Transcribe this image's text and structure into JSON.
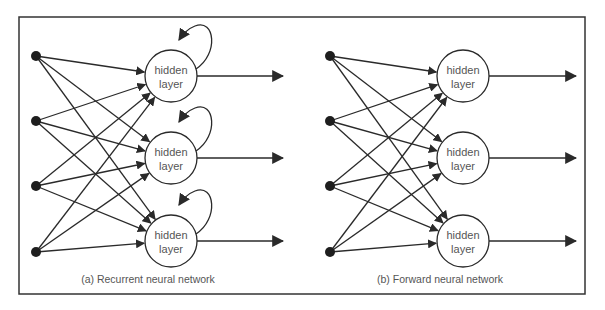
{
  "diagram": {
    "colors": {
      "stroke": "#2a2a2a",
      "text": "#555555",
      "frame": "#333333",
      "background": "#ffffff"
    },
    "frame": {
      "x": 19,
      "y": 17,
      "width": 566,
      "height": 277
    },
    "panels": [
      {
        "id": "recurrent",
        "caption": "(a) Recurrent neural network",
        "caption_pos": {
          "x": 148,
          "y": 283
        },
        "input_nodes": [
          {
            "x": 36,
            "y": 56
          },
          {
            "x": 36,
            "y": 121
          },
          {
            "x": 36,
            "y": 186
          },
          {
            "x": 36,
            "y": 252
          }
        ],
        "hidden_nodes": [
          {
            "x": 171,
            "y": 76,
            "line1": "hidden",
            "line2": "layer",
            "self_loop": true
          },
          {
            "x": 171,
            "y": 158,
            "line1": "hidden",
            "line2": "layer",
            "self_loop": true
          },
          {
            "x": 171,
            "y": 241,
            "line1": "hidden",
            "line2": "layer",
            "self_loop": true
          }
        ],
        "output_arrow_end_x": 283
      },
      {
        "id": "forward",
        "caption": "(b) Forward neural network",
        "caption_pos": {
          "x": 440,
          "y": 283
        },
        "input_nodes": [
          {
            "x": 330,
            "y": 56
          },
          {
            "x": 330,
            "y": 121
          },
          {
            "x": 330,
            "y": 186
          },
          {
            "x": 330,
            "y": 252
          }
        ],
        "hidden_nodes": [
          {
            "x": 463,
            "y": 76,
            "line1": "hidden",
            "line2": "layer",
            "self_loop": false
          },
          {
            "x": 463,
            "y": 158,
            "line1": "hidden",
            "line2": "layer",
            "self_loop": false
          },
          {
            "x": 463,
            "y": 241,
            "line1": "hidden",
            "line2": "layer",
            "self_loop": false
          }
        ],
        "output_arrow_end_x": 576
      }
    ],
    "hidden_radius": 26,
    "input_radius": 5
  }
}
